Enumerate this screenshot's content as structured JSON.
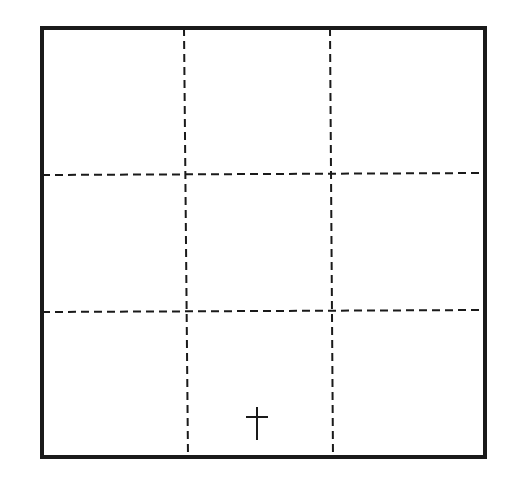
{
  "diagram": {
    "type": "3x3 grid with marker",
    "rows": 3,
    "cols": 3,
    "frame": {
      "x1": 42,
      "y1": 28,
      "x2": 485,
      "y2": 457,
      "stroke": "#1a1a1a",
      "width": 4
    },
    "grid_lines": {
      "vertical": [
        {
          "x_top": 184,
          "x_bottom": 188
        },
        {
          "x_top": 330,
          "x_bottom": 333
        }
      ],
      "horizontal": [
        {
          "y_left": 175,
          "y_right": 173
        },
        {
          "y_left": 312,
          "y_right": 310
        }
      ],
      "style": "dashed",
      "dash": "8 5",
      "stroke": "#1a1a1a",
      "width": 2
    },
    "marker": {
      "symbol": "cross",
      "cell": {
        "row": 3,
        "col": 2
      },
      "x": 257,
      "y_top": 407,
      "y_bottom": 440,
      "bar_y": 417,
      "bar_half_width": 11
    }
  }
}
